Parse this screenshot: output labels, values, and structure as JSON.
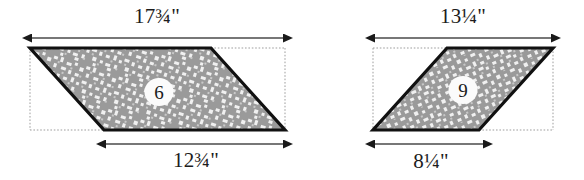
{
  "figure": {
    "background_color": "#ffffff",
    "outline_color": "#111111",
    "fill_color": "#9a9a9a",
    "speckle_color": "#f2f2f2",
    "guide_color": "#9b9b9b",
    "arrow_color": "#1a1a1a",
    "text_color": "#1c1c1c"
  },
  "pieces": [
    {
      "id": "piece-6",
      "number": "6",
      "shape": "parallelogram",
      "slant": "left-leaning",
      "top_dimension": "17¾\"",
      "bottom_dimension": "12¾\"",
      "top_dimension_value": 17.75,
      "bottom_dimension_value": 12.75,
      "units": "inches"
    },
    {
      "id": "piece-9",
      "number": "9",
      "shape": "parallelogram",
      "slant": "right-leaning",
      "top_dimension": "13¼\"",
      "bottom_dimension": "8¼\"",
      "top_dimension_value": 13.25,
      "bottom_dimension_value": 8.25,
      "units": "inches"
    }
  ],
  "labels": {
    "left_top": "17¾\"",
    "left_bottom": "12¾\"",
    "right_top": "13¼\"",
    "right_bottom": "8¼\"",
    "left_number": "6",
    "right_number": "9"
  },
  "icons": {
    "left_top_arrow": "double-headed-arrow-icon",
    "left_bottom_arrow": "double-headed-arrow-icon",
    "right_top_arrow": "double-headed-arrow-icon",
    "right_bottom_arrow": "double-headed-arrow-icon",
    "left_guide": "dotted-bounding-box-icon",
    "right_guide": "dotted-bounding-box-icon"
  }
}
